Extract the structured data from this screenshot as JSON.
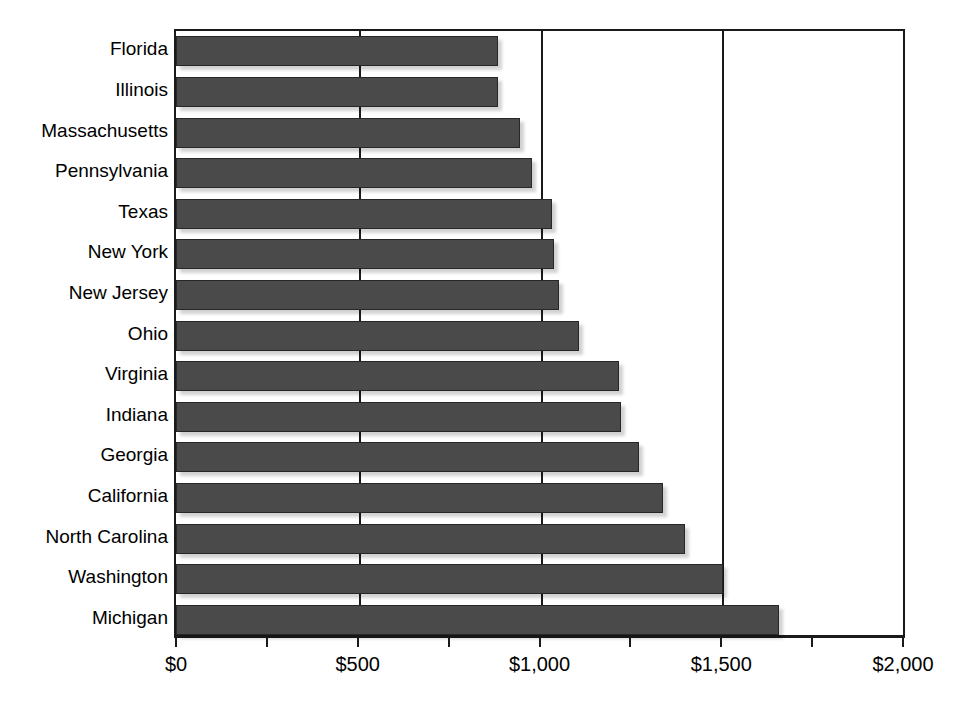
{
  "chart_data": {
    "type": "bar",
    "orientation": "horizontal",
    "title": "",
    "subtitle": "",
    "xlabel": "",
    "ylabel": "",
    "xlim": [
      0,
      2000
    ],
    "grid": true,
    "legend": false,
    "legend_position": "none",
    "bar_color": "#4a4a4a",
    "axis_color": "#1a1a1a",
    "background_color": "#ffffff",
    "categories": [
      "Florida",
      "Illinois",
      "Massachusetts",
      "Pennsylvania",
      "Texas",
      "New York",
      "New Jersey",
      "Ohio",
      "Virginia",
      "Indiana",
      "Georgia",
      "California",
      "North Carolina",
      "Washington",
      "Michigan"
    ],
    "values": [
      885,
      885,
      945,
      980,
      1035,
      1040,
      1055,
      1110,
      1220,
      1225,
      1275,
      1340,
      1400,
      1505,
      1660
    ],
    "x_ticks_major": [
      0,
      500,
      1000,
      1500,
      2000
    ],
    "x_ticks_minor": [
      250,
      750,
      1250,
      1750
    ],
    "x_tick_labels": [
      "$0",
      "$500",
      "$1,000",
      "$1,500",
      "$2,000"
    ]
  }
}
